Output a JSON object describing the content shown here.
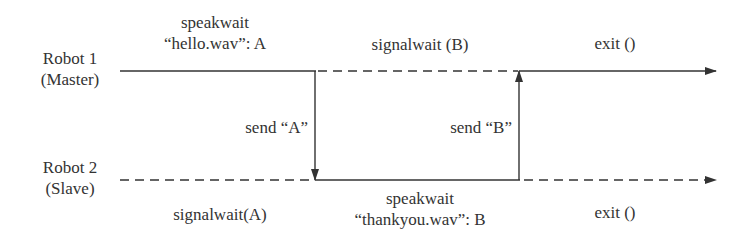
{
  "diagram": {
    "type": "sequence-timeline",
    "colors": {
      "line": "#333333",
      "text": "#333333",
      "background": "#ffffff"
    },
    "lanes": [
      {
        "id": "robot1",
        "name": "Robot 1",
        "role": "(Master)",
        "segments": [
          {
            "style": "solid",
            "label_line1": "speakwait",
            "label_line2": "“hello.wav”: A"
          },
          {
            "style": "dashed",
            "label_line1": "signalwait (B)"
          },
          {
            "style": "solid",
            "label_line1": "exit ()"
          }
        ]
      },
      {
        "id": "robot2",
        "name": "Robot 2",
        "role": "(Slave)",
        "segments": [
          {
            "style": "dashed",
            "label_line1": "signalwait(A)"
          },
          {
            "style": "solid",
            "label_line1": "speakwait",
            "label_line2": "“thankyou.wav”: B"
          },
          {
            "style": "dashed",
            "label_line1": "exit ()"
          }
        ]
      }
    ],
    "messages": [
      {
        "from": "robot1",
        "to": "robot2",
        "direction": "down",
        "label": "send “A”"
      },
      {
        "from": "robot2",
        "to": "robot1",
        "direction": "up",
        "label": "send “B”"
      }
    ]
  }
}
